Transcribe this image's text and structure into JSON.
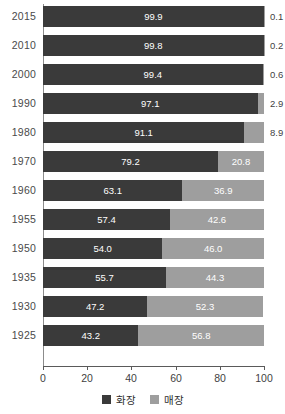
{
  "chart_data": {
    "type": "bar",
    "orientation": "horizontal",
    "stacked": true,
    "title": "",
    "xlabel": "",
    "ylabel": "",
    "xlim": [
      0,
      100
    ],
    "xticks": [
      0,
      20,
      40,
      60,
      80,
      100
    ],
    "grid": false,
    "legend_position": "bottom",
    "categories": [
      "2015",
      "2010",
      "2000",
      "1990",
      "1980",
      "1970",
      "1960",
      "1955",
      "1950",
      "1935",
      "1930",
      "1925"
    ],
    "series": [
      {
        "name": "화장",
        "color": "#3a3a3a",
        "values": [
          99.9,
          99.8,
          99.4,
          97.1,
          91.1,
          79.2,
          63.1,
          57.4,
          54.0,
          55.7,
          47.2,
          43.2
        ],
        "labels": [
          "99.9",
          "99.8",
          "99.4",
          "97.1",
          "91.1",
          "79.2",
          "63.1",
          "57.4",
          "54.0",
          "55.7",
          "47.2",
          "43.2"
        ]
      },
      {
        "name": "매장",
        "color": "#9e9e9e",
        "values": [
          0.1,
          0.2,
          0.6,
          2.9,
          8.9,
          20.8,
          36.9,
          42.6,
          46.0,
          44.3,
          52.3,
          56.8
        ],
        "labels": [
          "0.1",
          "0.2",
          "0.6",
          "2.9",
          "8.9",
          "20.8",
          "36.9",
          "42.6",
          "46.0",
          "44.3",
          "52.3",
          "56.8"
        ]
      }
    ]
  },
  "axis": {
    "tick_labels": [
      "0",
      "20",
      "40",
      "60",
      "80",
      "100"
    ]
  },
  "legend": {
    "items": [
      {
        "label": "화장",
        "color": "#3a3a3a"
      },
      {
        "label": "매장",
        "color": "#9e9e9e"
      }
    ]
  }
}
